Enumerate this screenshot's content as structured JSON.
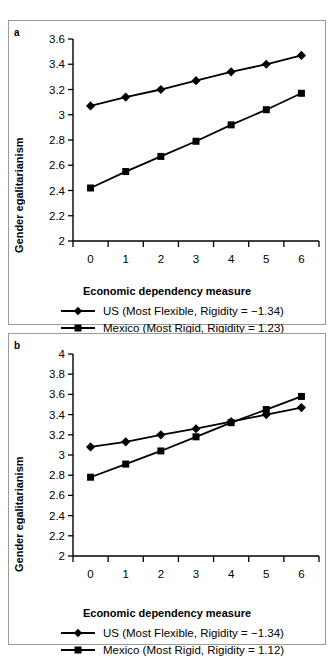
{
  "figure": {
    "panels": [
      {
        "id": "a",
        "label": "a",
        "xlabel": "Economic dependency measure",
        "ylabel": "Gender egalitarianism",
        "legend": [
          {
            "marker": "diamond",
            "text": "US (Most Flexible, Rigidity = −1.34)"
          },
          {
            "marker": "square",
            "text": "Mexico (Most Rigid, Rigidity = 1.23)"
          }
        ]
      },
      {
        "id": "b",
        "label": "b",
        "xlabel": "Economic dependency measure",
        "ylabel": "Gender egalitarianism",
        "legend": [
          {
            "marker": "diamond",
            "text": "US (Most Flexible, Rigidity = −1.34)"
          },
          {
            "marker": "square",
            "text": "Mexico (Most Rigid, Rigidity = 1.12)"
          }
        ]
      }
    ]
  },
  "chart_data": [
    {
      "type": "line",
      "panel": "a",
      "title": "",
      "xlabel": "Economic dependency measure",
      "ylabel": "Gender egalitarianism",
      "x": [
        0,
        1,
        2,
        3,
        4,
        5,
        6
      ],
      "xticklabels": [
        "0",
        "1",
        "2",
        "3",
        "4",
        "5",
        "6"
      ],
      "xlim": [
        -0.5,
        6.5
      ],
      "ylim": [
        2,
        3.6
      ],
      "yticks": [
        2,
        2.2,
        2.4,
        2.6,
        2.8,
        3,
        3.2,
        3.4,
        3.6
      ],
      "yticklabels": [
        "2",
        "2.2",
        "2.4",
        "2.6",
        "2.8",
        "3",
        "3.2",
        "3.4",
        "3.6"
      ],
      "grid": false,
      "legend_position": "below",
      "series": [
        {
          "name": "US (Most Flexible, Rigidity = −1.34)",
          "marker": "diamond",
          "color": "#000000",
          "values": [
            3.07,
            3.14,
            3.2,
            3.27,
            3.34,
            3.4,
            3.47
          ]
        },
        {
          "name": "Mexico (Most Rigid, Rigidity = 1.23)",
          "marker": "square",
          "color": "#000000",
          "values": [
            2.42,
            2.55,
            2.67,
            2.79,
            2.92,
            3.04,
            3.17
          ]
        }
      ]
    },
    {
      "type": "line",
      "panel": "b",
      "title": "",
      "xlabel": "Economic dependency measure",
      "ylabel": "Gender egalitarianism",
      "x": [
        0,
        1,
        2,
        3,
        4,
        5,
        6
      ],
      "xticklabels": [
        "0",
        "1",
        "2",
        "3",
        "4",
        "5",
        "6"
      ],
      "xlim": [
        -0.5,
        6.5
      ],
      "ylim": [
        2,
        4
      ],
      "yticks": [
        2,
        2.2,
        2.4,
        2.6,
        2.8,
        3,
        3.2,
        3.4,
        3.6,
        3.8,
        4
      ],
      "yticklabels": [
        "2",
        "2.2",
        "2.4",
        "2.6",
        "2.8",
        "3",
        "3.2",
        "3.4",
        "3.6",
        "3.8",
        "4"
      ],
      "grid": false,
      "legend_position": "below",
      "series": [
        {
          "name": "US (Most Flexible, Rigidity = −1.34)",
          "marker": "diamond",
          "color": "#000000",
          "values": [
            3.08,
            3.13,
            3.2,
            3.26,
            3.33,
            3.4,
            3.47
          ]
        },
        {
          "name": "Mexico (Most Rigid, Rigidity = 1.12)",
          "marker": "square",
          "color": "#000000",
          "values": [
            2.78,
            2.91,
            3.04,
            3.18,
            3.32,
            3.45,
            3.58
          ]
        }
      ]
    }
  ]
}
